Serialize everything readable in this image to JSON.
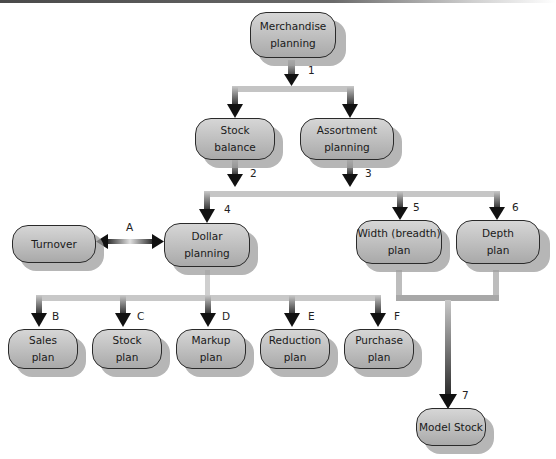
{
  "diagram": {
    "type": "flowchart",
    "nodes": {
      "merchandise_planning": "Merchandise\nplanning",
      "stock_balance": "Stock\nbalance",
      "assortment_planning": "Assortment\nplanning",
      "turnover": "Turnover",
      "dollar_planning": "Dollar\nplanning",
      "width_plan": "Width (breadth)\nplan",
      "depth_plan": "Depth\nplan",
      "sales_plan": "Sales\nplan",
      "stock_plan": "Stock\nplan",
      "markup_plan": "Markup\nplan",
      "reduction_plan": "Reduction\nplan",
      "purchase_plan": "Purchase\nplan",
      "model_stock": "Model Stock"
    },
    "step_labels": {
      "s1": "1",
      "s2": "2",
      "s3": "3",
      "s4": "4",
      "s5": "5",
      "s6": "6",
      "s7": "7",
      "a": "A",
      "b": "B",
      "c": "C",
      "d": "D",
      "e": "E",
      "f": "F"
    },
    "edges": [
      {
        "from": "Merchandise planning",
        "to": "Stock balance",
        "label": "1"
      },
      {
        "from": "Merchandise planning",
        "to": "Assortment planning",
        "label": "1"
      },
      {
        "from": "Stock balance",
        "to": "Dollar planning / Width plan / Depth plan",
        "label": "2"
      },
      {
        "from": "Assortment planning",
        "to": "Dollar planning / Width plan / Depth plan",
        "label": "3"
      },
      {
        "from": "bar",
        "to": "Dollar planning",
        "label": "4"
      },
      {
        "from": "bar",
        "to": "Width (breadth) plan",
        "label": "5"
      },
      {
        "from": "bar",
        "to": "Depth plan",
        "label": "6"
      },
      {
        "from": "Turnover",
        "to": "Dollar planning",
        "label": "A",
        "bidirectional": true
      },
      {
        "from": "Dollar planning",
        "to": "Sales plan",
        "label": "B"
      },
      {
        "from": "Dollar planning",
        "to": "Stock plan",
        "label": "C"
      },
      {
        "from": "Dollar planning",
        "to": "Markup plan",
        "label": "D"
      },
      {
        "from": "Dollar planning",
        "to": "Reduction plan",
        "label": "E"
      },
      {
        "from": "Dollar planning",
        "to": "Purchase plan",
        "label": "F"
      },
      {
        "from": "Width (breadth) plan + Depth plan",
        "to": "Model Stock",
        "label": "7"
      }
    ],
    "colors": {
      "node_fill_top": "#d6d6d6",
      "node_fill_bottom": "#a9a9a9",
      "node_border": "#2a2a2a",
      "shadow": "#9e9e9e",
      "connector_light": "#c8c8c8",
      "connector_dark": "#1a1a1a"
    }
  }
}
